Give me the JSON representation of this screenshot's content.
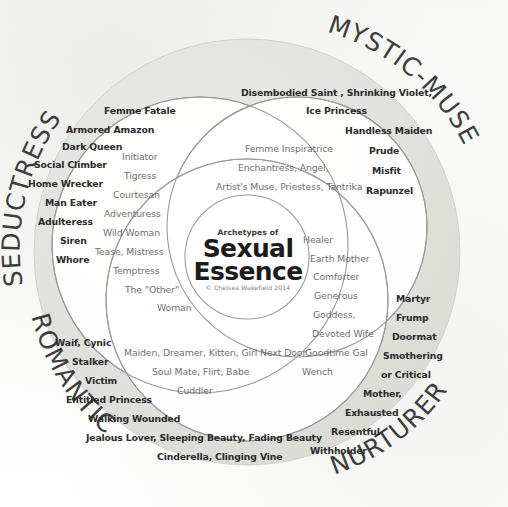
{
  "diagram": {
    "core": {
      "line_small": "Archetypes of",
      "line_big_1": "Sexual",
      "line_big_2": "Essence",
      "credit": "© Chelsea Wakefield 2014"
    },
    "quadrant_labels": {
      "top_left": "SEDUCTRESS",
      "top_right": "MYSTIC-MUSE",
      "bottom_left": "ROMANTIC",
      "bottom_right": "NURTURER"
    },
    "colors": {
      "page_background": "#fbfbfa",
      "outer_disc_fill": "#e2e2de",
      "petal_fill": "#ffffff",
      "outline_stroke": "#9a9a96",
      "outer_word_text": "#2b2b2b",
      "inner_word_text": "#6f6f6f",
      "core_text": "#1c1c1c",
      "quadrant_label_text": "#3d3d3d"
    },
    "seductress": {
      "outer_words": [
        "Femme Fatale",
        "Armored Amazon",
        "Dark Queen",
        "Social Climber",
        "Home Wrecker",
        "Man Eater",
        "Adulteress",
        "Siren",
        "Whore"
      ],
      "inner_words": [
        "Initiator",
        "Tigress",
        "Courtesan",
        "Adventuress",
        "Wild Woman",
        "Tease, Mistress",
        "Temptress",
        "The \"Other\"",
        "Woman"
      ]
    },
    "mystic_muse": {
      "outer_words": [
        "Disembodied Saint , Shrinking Violet,",
        "Ice Princess",
        "Handless Maiden",
        "Prude",
        "Misfit",
        "Rapunzel"
      ],
      "inner_words": [
        "Femme Inspiratrice",
        "Enchantress, Angel,",
        "Artist's Muse, Priestess, Tantrika"
      ]
    },
    "nurturer": {
      "outer_words": [
        "Martyr",
        "Frump",
        "Doormat",
        "Smothering",
        "or Critical",
        "Mother,",
        "Exhausted",
        "Resentful",
        "Withholder"
      ],
      "inner_words": [
        "Healer",
        "Earth Mother",
        "Comforter",
        "Generous",
        "Goddess,",
        "Devoted Wife",
        "Goodtime Gal",
        "Wench"
      ]
    },
    "romantic": {
      "outer_words": [
        "Waif, Cynic",
        "Stalker",
        "Victim",
        "Entitled Princess",
        "Walking Wounded",
        "Jealous Lover, Sleeping Beauty, Fading Beauty",
        "Cinderella, Clinging Vine"
      ],
      "inner_words": [
        "Maiden,  Dreamer, Kitten, Girl Next Door",
        "Soul Mate, Flirt, Babe",
        "Cuddler"
      ]
    }
  }
}
